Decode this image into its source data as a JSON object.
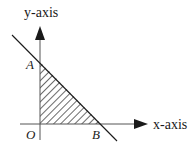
{
  "diagram": {
    "type": "coordinate-plane-shaded-triangle",
    "axes": {
      "x_label": "x-axis",
      "y_label": "y-axis"
    },
    "points": {
      "origin": "O",
      "a": "A",
      "b": "B"
    },
    "colors": {
      "stroke": "#1a1a1a",
      "axis": "#555555",
      "background": "#ffffff"
    }
  }
}
